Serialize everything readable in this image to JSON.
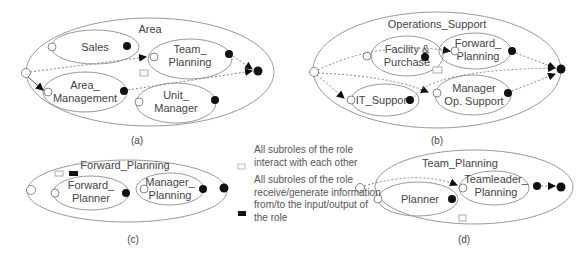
{
  "diagrams": {
    "a": {
      "title": "Area",
      "caption": "(a)",
      "subroles": [
        "Sales",
        "Team_",
        "Planning",
        "Area_",
        "Management",
        "Unit_",
        "Manager"
      ]
    },
    "b": {
      "title": "Operations_Support",
      "caption": "(b)",
      "subroles": [
        "Facility &",
        "Purchase",
        "Forward_",
        "Planning",
        "IT_Support",
        "Manager",
        "Op. Support"
      ]
    },
    "c": {
      "title": "Forward_Planning",
      "caption": "(c)",
      "subroles": [
        "Forward_",
        "Planner",
        "Manager_",
        "Planning"
      ]
    },
    "d": {
      "title": "Team_Planning",
      "caption": "(d)",
      "subroles": [
        "Planner",
        "Teamleader_",
        "Planning"
      ]
    }
  },
  "legend": {
    "items": [
      {
        "symbol": "white-box",
        "text": "All subroles of the role interact with each other"
      },
      {
        "symbol": "black-box",
        "text": "All subroles of the role receive/generate information from/to the input/output of the role"
      }
    ]
  },
  "colors": {
    "line": "#888888",
    "port_filled": "#111111",
    "port_open": "#ffffff"
  }
}
